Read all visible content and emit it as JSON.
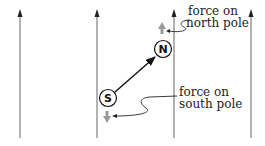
{
  "diagram": {
    "field_lines": [
      {
        "x": 20,
        "direction": "up"
      },
      {
        "x": 97,
        "direction": "up"
      },
      {
        "x": 174,
        "direction": "up"
      },
      {
        "x": 251,
        "direction": "up"
      }
    ],
    "poles": {
      "south": {
        "label": "S",
        "cx": 108,
        "cy": 98
      },
      "north": {
        "label": "N",
        "cx": 163,
        "cy": 49
      }
    },
    "labels": {
      "north_force_line1": "force on",
      "north_force_line2": "north pole",
      "south_force_line1": "force on",
      "south_force_line2": "south pole"
    },
    "colors": {
      "field_line": "#555555",
      "force_arrow": "#999999",
      "dipole_arrow": "#111111"
    }
  }
}
